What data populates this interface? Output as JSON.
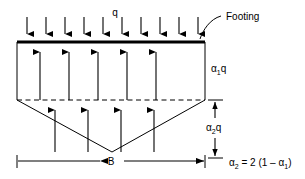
{
  "figure": {
    "type": "engineering-diagram",
    "background_color": "#ffffff",
    "line_color": "#000000",
    "width": 305,
    "height": 179
  },
  "labels": {
    "applied_load": "q",
    "footing": "Footing",
    "upper_pressure": "α₁q",
    "lower_pressure": "α₂q",
    "width_dimension": "B",
    "equation": "α₂ = 2 (1 – α₁)"
  },
  "geometry": {
    "footing": {
      "x1": 17,
      "x2": 205,
      "y": 42,
      "thickness": 3.2
    },
    "rectangle": {
      "left": 17,
      "right": 205,
      "top": 42,
      "bottom": 100
    },
    "dashed_line": {
      "x1": 17,
      "x2": 205,
      "y": 100
    },
    "wedge": {
      "left": 17,
      "right": 205,
      "top": 100,
      "apex_x": 112,
      "apex_y": 152
    },
    "dimension_B": {
      "x1": 17,
      "x2": 205,
      "y": 161
    },
    "dimension_alpha2q": {
      "x": 215,
      "y1": 100,
      "y2": 158
    }
  },
  "load_arrows_down": {
    "count": 10,
    "y_start": 17,
    "y_end": 41,
    "x_positions": [
      27,
      46,
      65,
      84,
      103,
      122,
      141,
      160,
      179,
      198
    ]
  },
  "reaction_arrows_upper": {
    "count": 5,
    "y_start": 100,
    "y_end": 45,
    "x_positions": [
      40,
      69,
      98,
      127,
      156
    ]
  },
  "reaction_arrows_lower": {
    "count": 4,
    "y_start": 152,
    "y_end": 103,
    "x_positions": [
      55,
      88,
      121,
      154
    ]
  },
  "stem_lines_upper": {
    "count": 5,
    "x_positions": [
      40,
      69,
      98,
      127,
      156
    ],
    "y_top": 46,
    "y_bottom": 100
  },
  "leader": {
    "from_x": 200,
    "from_y": 38,
    "to_x": 222,
    "to_y": 16,
    "label_x": 226,
    "label_y": 17
  }
}
